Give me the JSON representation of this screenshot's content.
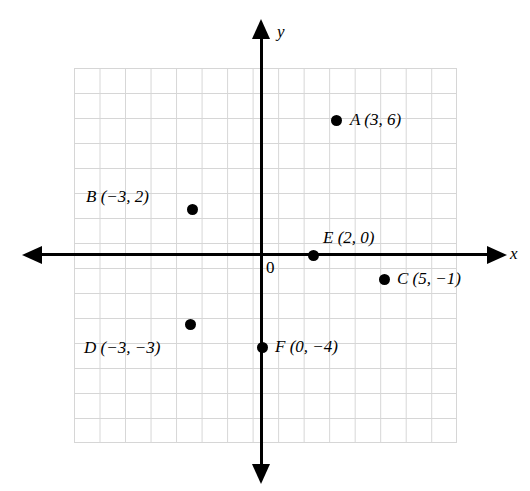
{
  "figure": {
    "type": "coordinate-plane",
    "top_caption": "",
    "origin_label": "0",
    "x_axis_label": "x",
    "y_axis_label": "y"
  },
  "chart_data": {
    "type": "scatter",
    "title": "",
    "xlabel": "x",
    "ylabel": "y",
    "grid": true,
    "legend": "none",
    "xlim": [
      -7,
      8
    ],
    "ylim": [
      -8,
      7
    ],
    "origin_label": "0",
    "unit_px": 25.5,
    "points": [
      {
        "name": "A",
        "x": 3,
        "y": 6,
        "label": "A (3, 6)",
        "label_side": "right"
      },
      {
        "name": "B",
        "x": -3,
        "y": 2,
        "label": "B (−3, 2)",
        "label_side": "left"
      },
      {
        "name": "C",
        "x": 5,
        "y": -1,
        "label": "C (5, −1)",
        "label_side": "right"
      },
      {
        "name": "D",
        "x": -3,
        "y": -3,
        "label": "D (−3, −3)",
        "label_side": "below"
      },
      {
        "name": "E",
        "x": 2,
        "y": 0,
        "label": "E (2, 0)",
        "label_side": "above"
      },
      {
        "name": "F",
        "x": 0,
        "y": -4,
        "label": "F (0, −4)",
        "label_side": "right"
      }
    ]
  },
  "points_render": {
    "A": {
      "dot_left": "336px",
      "dot_top": "120px",
      "label_left": "350px",
      "label_top": "110px"
    },
    "B": {
      "dot_left": "192px",
      "dot_top": "209px",
      "label_left": "86px",
      "label_top": "187px"
    },
    "C": {
      "dot_left": "384px",
      "dot_top": "279px",
      "label_left": "397px",
      "label_top": "269px"
    },
    "D": {
      "dot_left": "190px",
      "dot_top": "324px",
      "label_left": "84px",
      "label_top": "338px"
    },
    "E": {
      "dot_left": "313px",
      "dot_top": "255px",
      "label_left": "323px",
      "label_top": "228px"
    },
    "F": {
      "dot_left": "262px",
      "dot_top": "347px",
      "label_left": "275px",
      "label_top": "337px"
    }
  }
}
